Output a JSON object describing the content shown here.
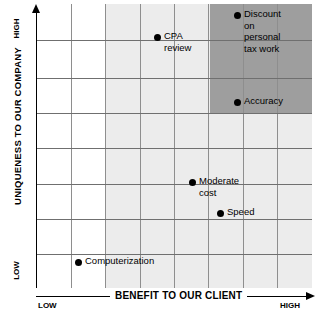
{
  "chart_data": {
    "type": "scatter",
    "title": "",
    "xlabel": "BENEFIT TO OUR CLIENT",
    "ylabel": "UNIQUENESS TO OUR COMPANY",
    "xlim": [
      0,
      7
    ],
    "ylim": [
      0,
      7
    ],
    "grid": true,
    "legend": "none",
    "axis_endpoints": {
      "x_low": "LOW",
      "x_high": "HIGH",
      "y_low": "LOW",
      "y_high": "HIGH"
    },
    "regions": [
      {
        "name": "light-shaded-band",
        "color": "#ececec",
        "x_range": [
          2.0,
          8.0
        ],
        "y_range": [
          0.0,
          8.0
        ]
      },
      {
        "name": "dark-shaded-quadrant",
        "color": "#9e9e9e",
        "x_range": [
          5.0,
          8.0
        ],
        "y_range": [
          5.0,
          8.0
        ]
      }
    ],
    "points": [
      {
        "label": "Discount on\npersonal\ntax work",
        "x": 5.85,
        "y": 7.72,
        "px": 237,
        "py": 15
      },
      {
        "label": "CPA review",
        "x": 3.53,
        "y": 7.17,
        "px": 157,
        "py": 37
      },
      {
        "label": "Accuracy",
        "x": 5.23,
        "y": 5.3,
        "px": 237,
        "py": 102
      },
      {
        "label": "Moderate cost",
        "x": 3.53,
        "y": 3.07,
        "px": 192,
        "py": 182
      },
      {
        "label": "Speed",
        "x": 4.35,
        "y": 2.2,
        "px": 220,
        "py": 213
      },
      {
        "label": "Computerization",
        "x": 1.2,
        "y": 0.96,
        "px": 78,
        "py": 262
      }
    ],
    "gridlines": {
      "vertical_px": [
        71,
        105,
        140,
        174,
        208,
        243,
        277
      ],
      "horizontal_px": [
        40,
        78,
        113,
        148,
        184,
        219,
        254
      ]
    },
    "colors": {
      "background": "#ffffff",
      "point": "#000000",
      "axis": "#000000",
      "grid": "#8e8e8e",
      "shade_light": "#ececec",
      "shade_dark": "#9e9e9e"
    }
  }
}
